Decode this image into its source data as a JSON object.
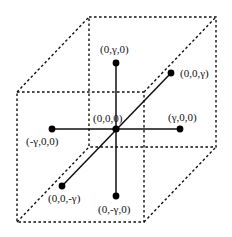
{
  "diagram": {
    "cube": {
      "back_face": {
        "tl": [
          89,
          17
        ],
        "tr": [
          216,
          17
        ],
        "br": [
          216,
          147
        ],
        "bl": [
          89,
          147
        ]
      },
      "front_face": {
        "tl": [
          17,
          92
        ],
        "tr": [
          144,
          92
        ],
        "br": [
          144,
          222
        ],
        "bl": [
          17,
          222
        ]
      },
      "line_style": "dashed",
      "color": "#111111"
    },
    "origin": {
      "label": "(0,0,0)",
      "pos": [
        116,
        129
      ],
      "label_pos": [
        93,
        122
      ]
    },
    "points": [
      {
        "id": "py",
        "label": "(0,γ,0)",
        "pos": [
          116,
          63
        ],
        "label_pos": [
          100,
          52
        ]
      },
      {
        "id": "pz",
        "label": "(0,0,γ)",
        "pos": [
          171,
          73
        ],
        "label_pos": [
          180,
          77
        ]
      },
      {
        "id": "px",
        "label": "(γ,0,0)",
        "pos": [
          180,
          129
        ],
        "label_pos": [
          168,
          121
        ]
      },
      {
        "id": "nx",
        "label": "(-γ,0,0)",
        "pos": [
          52,
          129
        ],
        "label_pos": [
          26,
          145
        ]
      },
      {
        "id": "nz",
        "label": "(0,0,-γ)",
        "pos": [
          62,
          186
        ],
        "label_pos": [
          48,
          202
        ]
      },
      {
        "id": "ny",
        "label": "(0,-γ,0)",
        "pos": [
          116,
          196
        ],
        "label_pos": [
          98,
          213
        ]
      }
    ],
    "colors": {
      "stroke": "#111111",
      "point": "#000000",
      "background": "#ffffff"
    }
  }
}
